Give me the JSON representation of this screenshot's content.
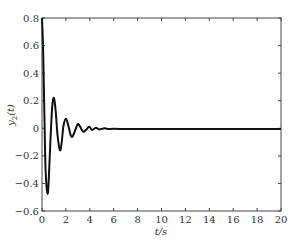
{
  "chart_data": {
    "type": "line",
    "title": "",
    "xlabel": "t/s",
    "ylabel": "y2(t)",
    "xlim": [
      0,
      20
    ],
    "ylim": [
      -0.6,
      0.8
    ],
    "grid": false,
    "legend": null,
    "x_ticks": [
      0,
      2,
      4,
      6,
      8,
      10,
      12,
      14,
      16,
      18,
      20
    ],
    "x_tick_labels": [
      "0",
      "2",
      "4",
      "6",
      "8",
      "10",
      "12",
      "14",
      "16",
      "18",
      "20"
    ],
    "y_ticks": [
      -0.6,
      -0.4,
      -0.2,
      0,
      0.2,
      0.4,
      0.6,
      0.8
    ],
    "y_tick_labels": [
      "-0.6",
      "-0.4",
      "-0.2",
      "0",
      "0.2",
      "0.4",
      "0.6",
      "0.8"
    ],
    "series": [
      {
        "name": "y2(t)",
        "color": "#111111",
        "x": [
          0,
          0.1,
          0.2,
          0.3,
          0.45,
          0.55,
          0.7,
          0.85,
          1.0,
          1.15,
          1.3,
          1.5,
          1.65,
          1.8,
          2.0,
          2.2,
          2.4,
          2.55,
          2.75,
          3.0,
          3.2,
          3.45,
          3.7,
          3.95,
          4.2,
          4.5,
          4.8,
          5.2,
          5.6,
          6.0,
          7.0,
          8.0,
          10.0,
          12.0,
          14.0,
          16.0,
          18.0,
          20.0
        ],
        "y": [
          0.8,
          0.55,
          0.1,
          -0.3,
          -0.47,
          -0.4,
          -0.1,
          0.15,
          0.22,
          0.12,
          -0.05,
          -0.16,
          -0.1,
          0.02,
          0.07,
          0.02,
          -0.05,
          -0.06,
          -0.02,
          0.03,
          0.01,
          -0.025,
          -0.01,
          0.012,
          -0.012,
          0.004,
          -0.008,
          0.0,
          -0.006,
          -0.004,
          -0.005,
          -0.005,
          -0.005,
          -0.005,
          -0.005,
          -0.005,
          -0.005,
          -0.005
        ]
      }
    ]
  }
}
